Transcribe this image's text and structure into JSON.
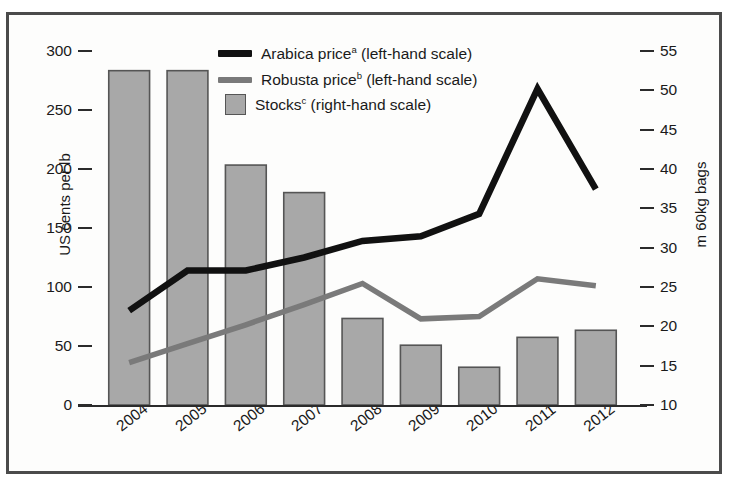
{
  "chart_data": {
    "type": "bar",
    "title": "",
    "categories": [
      "2004",
      "2005",
      "2006",
      "2007",
      "2008",
      "2009",
      "2010",
      "2011",
      "2012"
    ],
    "category_superscripts": [
      "",
      "",
      "",
      "",
      "",
      "",
      "",
      "",
      "d"
    ],
    "xlabel": "",
    "grid": false,
    "legend_position": "top-center",
    "axes": {
      "left": {
        "label": "US cents per lb",
        "ticks": [
          0,
          50,
          100,
          150,
          200,
          250,
          300
        ],
        "ylim": [
          0,
          300
        ]
      },
      "right": {
        "label": "m 60kg bags",
        "ticks": [
          10,
          15,
          20,
          25,
          30,
          35,
          40,
          45,
          50,
          55
        ],
        "ylim": [
          10,
          55
        ]
      }
    },
    "series": [
      {
        "name": "Arabica price",
        "superscript": "a",
        "legend_label": "Arabica priceᵃ (left-hand scale)",
        "type": "line",
        "axis": "left",
        "color": "#111111",
        "values": [
          80,
          114,
          114,
          125,
          139,
          143,
          162,
          268,
          183
        ]
      },
      {
        "name": "Robusta price",
        "superscript": "b",
        "legend_label": "Robusta priceᵇ (left-hand scale)",
        "type": "line",
        "axis": "left",
        "color": "#7a7a7a",
        "values": [
          36,
          52,
          68,
          85,
          103,
          73,
          75,
          107,
          101
        ]
      },
      {
        "name": "Stocks",
        "superscript": "c",
        "legend_label": "Stocksᶜ (right-hand scale)",
        "type": "bar",
        "axis": "right",
        "color": "#a8a8a8",
        "edge_color": "#555555",
        "values": [
          52.5,
          52.5,
          40.5,
          37.0,
          21.0,
          17.6,
          14.8,
          18.6,
          19.5
        ]
      }
    ]
  },
  "legend": {
    "items": [
      {
        "label": "Arabica price",
        "sup": "a",
        "suffix": " (left-hand scale)",
        "kind": "line",
        "color": "#111111"
      },
      {
        "label": "Robusta price",
        "sup": "b",
        "suffix": " (left-hand scale)",
        "kind": "line",
        "color": "#7a7a7a"
      },
      {
        "label": "Stocks",
        "sup": "c",
        "suffix": " (right-hand scale)",
        "kind": "box",
        "color": "#a8a8a8"
      }
    ]
  },
  "colors": {
    "frame": "#4b4b4b",
    "background": "#fdfdfc",
    "arabica": "#111111",
    "robusta": "#7a7a7a",
    "bar_fill": "#a8a8a8",
    "bar_edge": "#555555",
    "text": "#1a1a1a"
  }
}
